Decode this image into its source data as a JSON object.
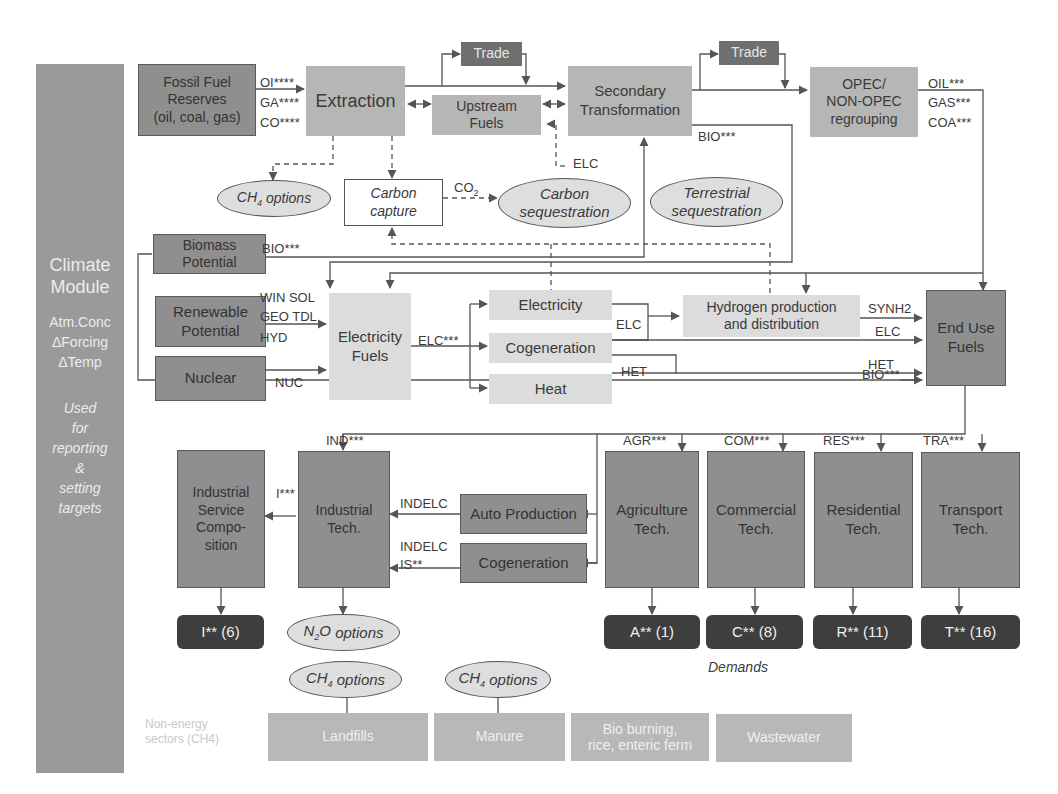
{
  "climate_module": {
    "title_line1": "Climate",
    "title_line2": "Module",
    "vars": [
      "Atm.Conc",
      "ΔForcing",
      "ΔTemp"
    ],
    "note": [
      "Used",
      "for",
      "reporting",
      "&",
      "setting",
      "targets"
    ]
  },
  "supply": {
    "fossil_reserves": [
      "Fossil Fuel",
      "Reserves",
      "(oil, coal, gas)"
    ],
    "fossil_outputs": [
      "OI****",
      "GA****",
      "CO****"
    ],
    "extraction": "Extraction",
    "trade_1": "Trade",
    "trade_2": "Trade",
    "upstream_fuels": [
      "Upstream",
      "Fuels"
    ],
    "secondary_transformation": [
      "Secondary",
      "Transformation"
    ],
    "opec": [
      "OPEC/",
      "NON-OPEC",
      "regrouping"
    ],
    "opec_outputs": [
      "OIL***",
      "GAS***",
      "COA***"
    ],
    "sec_bio_label": "BIO***",
    "upstream_elc_label": "ELC"
  },
  "sequestration": {
    "ch4_options_extraction": "options",
    "carbon_capture": [
      "Carbon",
      "capture"
    ],
    "co2_label": "CO",
    "co2_sub": "2",
    "carbon_sequestration": [
      "Carbon",
      "sequestration"
    ],
    "terrestrial_sequestration": [
      "Terrestrial",
      "sequestration"
    ]
  },
  "potentials": {
    "biomass": [
      "Biomass",
      "Potential"
    ],
    "biomass_label": "BIO***",
    "renewable": [
      "Renewable",
      "Potential"
    ],
    "renewable_labels": [
      "WIN SOL",
      "GEO TDL",
      "HYD"
    ],
    "nuclear": "Nuclear",
    "nuclear_label": "NUC"
  },
  "electricity": {
    "electricity_fuels": [
      "Electricity",
      "Fuels"
    ],
    "elc_label": "ELC***",
    "electricity": "Electricity",
    "cogeneration": "Cogeneration",
    "heat": "Heat",
    "elc_mid_label": "ELC",
    "het_label": "HET",
    "hydrogen": [
      "Hydrogen production",
      "and distribution"
    ]
  },
  "end_use": {
    "box": [
      "End Use",
      "Fuels"
    ],
    "inputs": [
      "SYNH2",
      "ELC",
      "HET",
      "BIO***"
    ]
  },
  "demand_sectors": {
    "ind_label": "IND***",
    "industrial_service": [
      "Industrial",
      "Service",
      "Compo-",
      "sition"
    ],
    "i_label": "I***",
    "industrial_tech": [
      "Industrial",
      "Tech."
    ],
    "auto_production": "Auto Production",
    "cogeneration": "Cogeneration",
    "indelc_1": "INDELC",
    "indelc_2": "INDELC",
    "is_label": "IS**",
    "sectors": [
      {
        "label": "AGR***",
        "name": [
          "Agriculture",
          "Tech."
        ],
        "demand": "A** (1)"
      },
      {
        "label": "COM***",
        "name": [
          "Commercial",
          "Tech."
        ],
        "demand": "C** (8)"
      },
      {
        "label": "RES***",
        "name": [
          "Residential",
          "Tech."
        ],
        "demand": "R** (11)"
      },
      {
        "label": "TRA***",
        "name": [
          "Transport",
          "Tech."
        ],
        "demand": "T** (16)"
      }
    ],
    "industrial_demand": "I** (6)",
    "n2o_options": "options",
    "demands_caption": "Demands"
  },
  "non_energy": {
    "caption": [
      "Non-energy",
      "sectors (CH4)"
    ],
    "ch4_options_1": "options",
    "ch4_options_2": "options",
    "sectors": [
      "Landfills",
      "Manure",
      [
        "Bio burning,",
        "rice, enteric ferm"
      ],
      "Wastewater"
    ]
  },
  "colors": {
    "dark_box": "#8f8f8f",
    "mid_box": "#b6b6b6",
    "light_box": "#dcdcdc",
    "trade_box": "#6f6f6f",
    "demand_box": "#3e3e3e",
    "side_panel": "#9a9a9a",
    "line": "#555555"
  }
}
